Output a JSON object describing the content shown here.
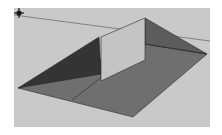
{
  "viewport": {
    "type": "3d-modeling-canvas",
    "background_color": "#c9c9c9",
    "colors": {
      "horizon_line": "#6e6e6e",
      "roof_left_dark": "#303030",
      "roof_main": "#6f6f6f",
      "roof_right": "#5e5e5e",
      "wall_face": "#c4c4c4",
      "edge": "#2a2a2a"
    },
    "cursor": {
      "icon": "move-cursor-icon",
      "color": "#1a1a1a"
    }
  }
}
